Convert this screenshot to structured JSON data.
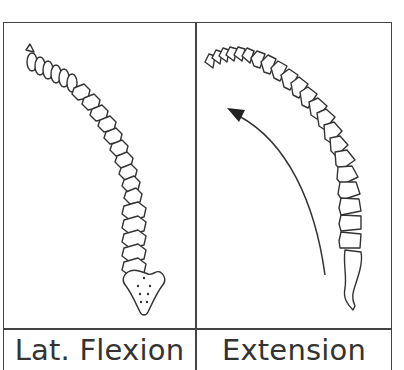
{
  "panels": [
    {
      "id": "lateral-flexion",
      "label": "Lat. Flexion",
      "illustration": "spine-lateral-flexion-posterior-view"
    },
    {
      "id": "extension",
      "label": "Extension",
      "illustration": "spine-extension-lateral-view",
      "arrow": "curved-arrow-up-left"
    }
  ],
  "colors": {
    "line": "#333333",
    "border": "#444444",
    "background": "#ffffff"
  }
}
